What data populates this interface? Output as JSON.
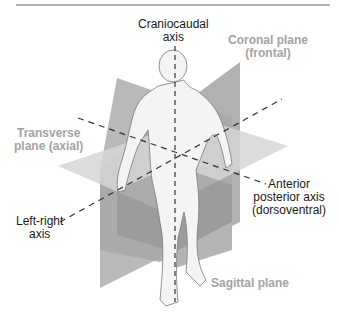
{
  "figure": {
    "colors": {
      "rule": "#9a9a9a",
      "plane_light": "#cfcfcf",
      "plane_mid": "#b4b4b4",
      "plane_dark": "#8f8f8f",
      "body_fill": "#f4f4f4",
      "body_outline": "#7a7a7a",
      "axis_line": "#333333",
      "axis_text": "#1a1a1a",
      "plane_text": "#a3a3a3"
    }
  },
  "labels": {
    "craniocaudal": {
      "line1": "Craniocaudal",
      "line2": "axis"
    },
    "coronal": {
      "line1": "Coronal plane",
      "line2": "(frontal)"
    },
    "transverse": {
      "line1": "Transverse",
      "line2": "plane (axial)"
    },
    "anterior_posterior": {
      "line1": "Anterior",
      "line2": "posterior axis",
      "line3": "(dorsoventral)"
    },
    "left_right": {
      "line1": "Left-right",
      "line2": "axis"
    },
    "sagittal": {
      "line1": "Sagittal plane"
    }
  }
}
